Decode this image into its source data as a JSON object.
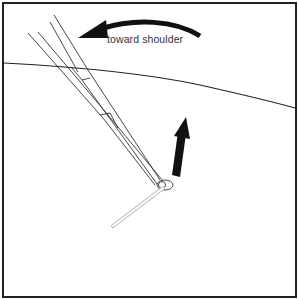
{
  "diagram": {
    "type": "medical-illustration",
    "labels": {
      "direction_label": "toward shoulder"
    },
    "elements": [
      {
        "name": "skin-surface-line"
      },
      {
        "name": "forceps"
      },
      {
        "name": "curved-arrow",
        "direction": "leftward toward shoulder"
      },
      {
        "name": "straight-arrow",
        "direction": "upward"
      },
      {
        "name": "needle"
      }
    ],
    "colors": {
      "border": "#222222",
      "line": "#222222",
      "arrow": "#111111",
      "needle": "#bbbbbb",
      "background": "#ffffff"
    }
  }
}
